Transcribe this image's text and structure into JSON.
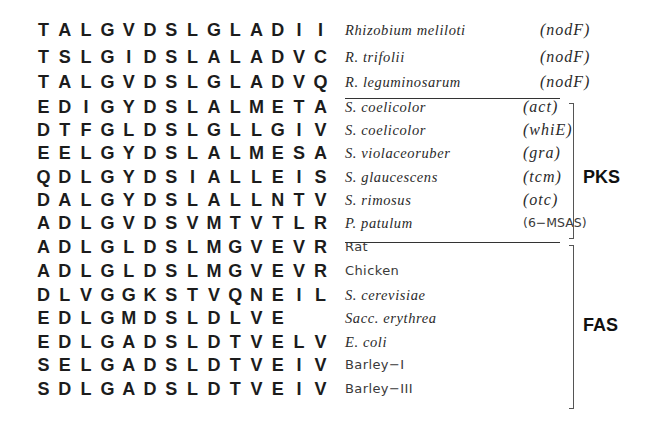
{
  "alignment": {
    "rows": [
      {
        "sequence": [
          "T",
          "A",
          "L",
          "G",
          "V",
          "D",
          "S",
          "L",
          "G",
          "L",
          "A",
          "D",
          "I",
          "I"
        ],
        "organism": "Rhizobium meliloti",
        "gene": "(nodF)",
        "organism_style": "italic",
        "gene_style": "italic",
        "group": ""
      },
      {
        "sequence": [
          "T",
          "S",
          "L",
          "G",
          "I",
          "D",
          "S",
          "L",
          "A",
          "L",
          "A",
          "D",
          "V",
          "C"
        ],
        "organism": "R. trifolii",
        "gene": "(nodF)",
        "organism_style": "italic",
        "gene_style": "italic",
        "group": ""
      },
      {
        "sequence": [
          "T",
          "A",
          "L",
          "G",
          "V",
          "D",
          "S",
          "L",
          "G",
          "L",
          "A",
          "D",
          "V",
          "Q"
        ],
        "organism": "R. leguminosarum",
        "gene": "(nodF)",
        "organism_style": "italic",
        "gene_style": "italic",
        "group": ""
      },
      {
        "sequence": [
          "E",
          "D",
          "I",
          "G",
          "Y",
          "D",
          "S",
          "L",
          "A",
          "L",
          "M",
          "E",
          "T",
          "A"
        ],
        "organism": "S. coelicolor",
        "gene": "(act)",
        "organism_style": "italic",
        "gene_style": "italic",
        "group": "PKS"
      },
      {
        "sequence": [
          "D",
          "T",
          "F",
          "G",
          "L",
          "D",
          "S",
          "L",
          "G",
          "L",
          "L",
          "G",
          "I",
          "V"
        ],
        "organism": "S. coelicolor",
        "gene": "(whiE)",
        "organism_style": "italic",
        "gene_style": "italic",
        "group": "PKS"
      },
      {
        "sequence": [
          "E",
          "E",
          "L",
          "G",
          "Y",
          "D",
          "S",
          "L",
          "A",
          "L",
          "M",
          "E",
          "S",
          "A"
        ],
        "organism": "S. violaceoruber",
        "gene": "(gra)",
        "organism_style": "italic",
        "gene_style": "italic",
        "group": "PKS"
      },
      {
        "sequence": [
          "Q",
          "D",
          "L",
          "G",
          "Y",
          "D",
          "S",
          "I",
          "A",
          "L",
          "L",
          "E",
          "I",
          "S"
        ],
        "organism": "S. glaucescens",
        "gene": "(tcm)",
        "organism_style": "italic",
        "gene_style": "italic",
        "group": "PKS"
      },
      {
        "sequence": [
          "D",
          "A",
          "L",
          "G",
          "Y",
          "D",
          "S",
          "L",
          "A",
          "L",
          "L",
          "N",
          "T",
          "V"
        ],
        "organism": "S. rimosus",
        "gene": "(otc)",
        "organism_style": "italic",
        "gene_style": "italic",
        "group": "PKS"
      },
      {
        "sequence": [
          "A",
          "D",
          "L",
          "G",
          "V",
          "D",
          "S",
          "V",
          "M",
          "T",
          "V",
          "T",
          "L",
          "R"
        ],
        "organism": "P. patulum",
        "gene": "(6−MSAS)",
        "organism_style": "italic",
        "gene_style": "roman",
        "group": "PKS"
      },
      {
        "sequence": [
          "A",
          "D",
          "L",
          "G",
          "L",
          "D",
          "S",
          "L",
          "M",
          "G",
          "V",
          "E",
          "V",
          "R"
        ],
        "organism": "Rat",
        "gene": "",
        "organism_style": "roman",
        "gene_style": "roman",
        "group": "FAS"
      },
      {
        "sequence": [
          "A",
          "D",
          "L",
          "G",
          "L",
          "D",
          "S",
          "L",
          "M",
          "G",
          "V",
          "E",
          "V",
          "R"
        ],
        "organism": "Chicken",
        "gene": "",
        "organism_style": "roman",
        "gene_style": "roman",
        "group": "FAS"
      },
      {
        "sequence": [
          "D",
          "L",
          "V",
          "G",
          "G",
          "K",
          "S",
          "T",
          "V",
          "Q",
          "N",
          "E",
          "I",
          "L"
        ],
        "organism": "S. cerevisiae",
        "gene": "",
        "organism_style": "italic",
        "gene_style": "roman",
        "group": "FAS"
      },
      {
        "sequence": [
          "E",
          "D",
          "L",
          "G",
          "M",
          "D",
          "S",
          "L",
          "D",
          "L",
          "V",
          "E",
          "",
          ""
        ],
        "organism": "Sacc. erythrea",
        "gene": "",
        "organism_style": "italic",
        "gene_style": "roman",
        "group": "FAS"
      },
      {
        "sequence": [
          "E",
          "D",
          "L",
          "G",
          "A",
          "D",
          "S",
          "L",
          "D",
          "T",
          "V",
          "E",
          "L",
          "V"
        ],
        "organism": "E. coli",
        "gene": "",
        "organism_style": "italic",
        "gene_style": "roman",
        "group": "FAS"
      },
      {
        "sequence": [
          "S",
          "E",
          "L",
          "G",
          "A",
          "D",
          "S",
          "L",
          "D",
          "T",
          "V",
          "E",
          "I",
          "V"
        ],
        "organism": "Barley−I",
        "gene": "",
        "organism_style": "roman",
        "gene_style": "roman",
        "group": "FAS"
      },
      {
        "sequence": [
          "S",
          "D",
          "L",
          "G",
          "A",
          "D",
          "S",
          "L",
          "D",
          "T",
          "V",
          "E",
          "I",
          "V"
        ],
        "organism": "Barley−III",
        "gene": "",
        "organism_style": "roman",
        "gene_style": "roman",
        "group": "FAS"
      }
    ]
  },
  "groups": {
    "pks": {
      "label": "PKS"
    },
    "fas": {
      "label": "FAS"
    }
  }
}
